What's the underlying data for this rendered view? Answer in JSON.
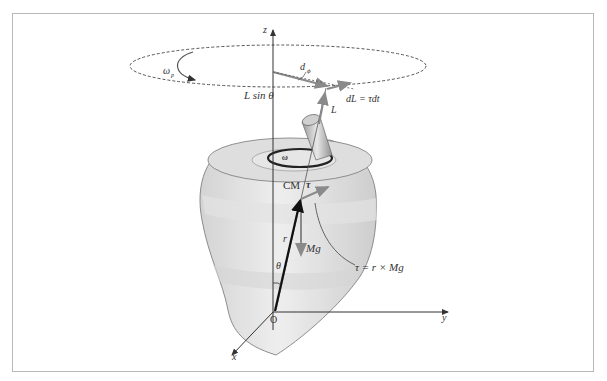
{
  "figure": {
    "axes": {
      "z": "z",
      "y": "y",
      "x": "x",
      "origin": "O"
    },
    "labels": {
      "precession_rate": "ω",
      "precession_rate_sub": "p",
      "spin_rate": "ω",
      "d_phi": "d",
      "d_phi_sub": "ϕ",
      "l_sin_theta": "L sin θ",
      "d_l": "dL = τdt",
      "angular_momentum": "L",
      "center_of_mass": "CM",
      "torque": "τ",
      "position_vector": "r",
      "gravity": "Mg",
      "angle": "θ",
      "torque_formula": "τ = r × Mg"
    },
    "colors": {
      "frame": "#b8b8b8",
      "vector_gray": "#8a8a8a",
      "vector_black": "#111111",
      "body_fill": "#dcdcdc",
      "body_band": "#e9e9e9",
      "axis": "#333333"
    }
  }
}
